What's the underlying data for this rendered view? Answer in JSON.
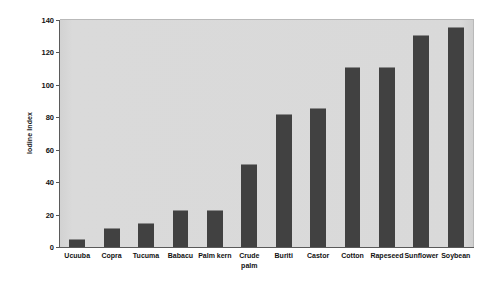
{
  "chart_data": {
    "type": "bar",
    "title": "",
    "subtitle": "",
    "xlabel": "",
    "ylabel": "Iodine Index",
    "ylim": [
      0,
      140
    ],
    "yticks": [
      0,
      20,
      40,
      60,
      80,
      100,
      120,
      140
    ],
    "ytick_labels": [
      "0",
      "20",
      "40",
      "60",
      "80",
      "100",
      "120",
      "140"
    ],
    "grid": false,
    "legend": null,
    "legend_position": "none",
    "plot_background": "#d7d7d7",
    "bar_color": "#414141",
    "categories": [
      "Ucuuba",
      "Copra",
      "Tucuma",
      "Babacu",
      "Palm kern",
      "Crude\npalm",
      "Buriti",
      "Castor",
      "Cotton",
      "Rapeseed",
      "Sunflower",
      "Soybean"
    ],
    "values": [
      5,
      12,
      15,
      23,
      23,
      51,
      82,
      86,
      111,
      111,
      131,
      136
    ]
  }
}
